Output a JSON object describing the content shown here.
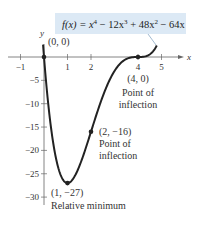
{
  "chart_data": {
    "type": "line",
    "title_parts": {
      "lhs": "f(x) = x",
      "e1": "4",
      "t2": " − 12x",
      "e2": "3",
      "t3": " + 48x",
      "e3": "2",
      "t4": " − 64x"
    },
    "xlabel": "x",
    "ylabel": "y",
    "xlim": [
      -1,
      5
    ],
    "ylim": [
      -30,
      0
    ],
    "grid": false,
    "x_ticks": [
      -1,
      1,
      2,
      4,
      5
    ],
    "x_tick_labels": [
      "−1",
      "1",
      "2",
      "4",
      "5"
    ],
    "y_ticks": [
      -5,
      -10,
      -15,
      -20,
      -25,
      -30
    ],
    "y_tick_labels": [
      "−5",
      "−10",
      "−15",
      "−20",
      "−25",
      "−30"
    ],
    "series": [
      {
        "name": "f(x)",
        "coefficients": {
          "x4": 1,
          "x3": -12,
          "x2": 48,
          "x1": -64,
          "x0": 0
        },
        "x_range": [
          -0.04,
          4.8
        ],
        "color": "#222222"
      }
    ],
    "points": [
      {
        "x": 0,
        "y": 0,
        "label": "(0, 0)"
      },
      {
        "x": 4,
        "y": 0,
        "label": "(4, 0)",
        "note_line1": "Point of",
        "note_line2": "inflection"
      },
      {
        "x": 2,
        "y": -16,
        "label": "(2, −16)",
        "note_line1": "Point of",
        "note_line2": "inflection"
      },
      {
        "x": 1,
        "y": -27,
        "label": "(1, −27)",
        "note_line1": "Relative minimum"
      }
    ],
    "colors": {
      "formula_box": "#dce9f5",
      "curve": "#222222",
      "axis": "#555555"
    }
  }
}
